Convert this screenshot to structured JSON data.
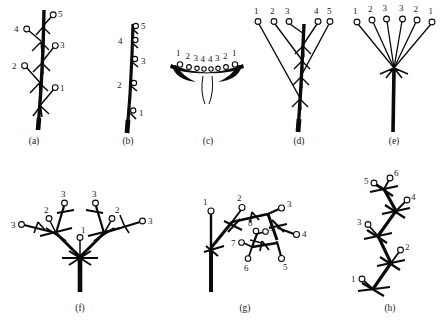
{
  "figure": {
    "background_color": "#ffffff",
    "ink_color": "#0a0a0a",
    "flower_fill_color": "#ffffff",
    "width": 443,
    "height": 327
  },
  "panels": [
    {
      "id": "a",
      "caption": "(a)",
      "caption_x": 34,
      "caption_y": 142,
      "type": "raceme",
      "origin_x": 6,
      "origin_y": 4,
      "axis": {
        "x1": 38,
        "y1": 127,
        "x2": 44,
        "y2": 10
      },
      "flowers": [
        {
          "label": "1",
          "node_x": 40.5,
          "node_y": 105,
          "tip_x": 54,
          "tip_y": 89,
          "num_x": 60,
          "num_y": 88
        },
        {
          "label": "2",
          "node_x": 39.5,
          "node_y": 82,
          "tip_x": 25,
          "tip_y": 66,
          "num_x": 13,
          "num_y": 66
        },
        {
          "label": "3",
          "node_x": 42,
          "node_y": 62,
          "tip_x": 54,
          "tip_y": 46,
          "num_x": 60,
          "num_y": 44
        },
        {
          "label": "4",
          "node_x": 41,
          "node_y": 41,
          "tip_x": 27,
          "tip_y": 29,
          "num_x": 16,
          "num_y": 29
        },
        {
          "label": "5",
          "node_x": 43,
          "node_y": 26,
          "tip_x": 52,
          "tip_y": 15,
          "num_x": 58,
          "num_y": 14
        }
      ],
      "flower_numbers": [
        "1",
        "2",
        "3",
        "4",
        "5"
      ]
    },
    {
      "id": "b",
      "caption": "(b)",
      "caption_x": 128,
      "caption_y": 142,
      "type": "spike",
      "origin_x": 100,
      "origin_y": 4,
      "axis": {
        "x1": 128,
        "y1": 131,
        "x2": 133,
        "y2": 20
      },
      "flowers": [
        {
          "label": "1",
          "node_x": 129.5,
          "node_y": 111,
          "num_x": 139,
          "num_y": 115
        },
        {
          "label": "2",
          "node_x": 130.5,
          "node_y": 84,
          "num_x": 118,
          "num_y": 87
        },
        {
          "label": "3",
          "node_x": 131.5,
          "node_y": 60,
          "num_x": 140,
          "num_y": 63
        },
        {
          "label": "4",
          "node_x": 132,
          "node_y": 41,
          "num_x": 119,
          "num_y": 43
        },
        {
          "label": "5",
          "node_x": 133,
          "node_y": 27,
          "num_x": 141,
          "num_y": 28
        }
      ],
      "flower_numbers": [
        "1",
        "2",
        "3",
        "4",
        "5"
      ]
    },
    {
      "id": "c",
      "caption": "(c)",
      "caption_x": 208,
      "caption_y": 142,
      "type": "capitulum-head",
      "origin_x": 160,
      "origin_y": 40,
      "receptacle": {
        "cx": 207,
        "cy": 68,
        "rx": 36,
        "ry": 7
      },
      "flowers": [
        {
          "label": "1",
          "node_x": 180,
          "node_y": 64,
          "num_x": 177,
          "num_y": 53
        },
        {
          "label": "2",
          "node_x": 189,
          "node_y": 66.5,
          "num_x": 186,
          "num_y": 56
        },
        {
          "label": "3",
          "node_x": 197,
          "node_y": 68,
          "num_x": 194,
          "num_y": 58.5
        },
        {
          "label": "4",
          "node_x": 204,
          "node_y": 68.5,
          "num_x": 201.5,
          "num_y": 59
        },
        {
          "label": "4",
          "node_x": 211,
          "node_y": 68.5,
          "num_x": 209,
          "num_y": 59
        },
        {
          "label": "3",
          "node_x": 218,
          "node_y": 68,
          "num_x": 216,
          "num_y": 58.5
        },
        {
          "label": "2",
          "node_x": 226,
          "node_y": 66.5,
          "num_x": 224,
          "num_y": 56
        },
        {
          "label": "1",
          "node_x": 235,
          "node_y": 64,
          "num_x": 233,
          "num_y": 53
        }
      ],
      "flower_numbers": [
        "1",
        "2",
        "3",
        "4",
        "4",
        "3",
        "2",
        "1"
      ]
    },
    {
      "id": "d",
      "caption": "(d)",
      "caption_x": 299,
      "caption_y": 142,
      "type": "corymb",
      "origin_x": 248,
      "origin_y": 4,
      "axis": {
        "x1": 299,
        "y1": 131,
        "x2": 303,
        "y2": 24
      },
      "flowers": [
        {
          "label": "1",
          "node_x": 300,
          "node_y": 98,
          "tip_x": 258,
          "tip_y": 22,
          "num_x": 255,
          "num_y": 13
        },
        {
          "label": "2",
          "node_x": 301,
          "node_y": 76,
          "tip_x": 330,
          "tip_y": 22,
          "num_x": 328,
          "num_y": 13
        },
        {
          "label": "3",
          "node_x": 301.5,
          "node_y": 60,
          "tip_x": 274,
          "tip_y": 22,
          "num_x": 271,
          "num_y": 13
        },
        {
          "label": "4",
          "node_x": 302,
          "node_y": 45,
          "tip_x": 317,
          "tip_y": 22,
          "num_x": 314,
          "num_y": 13
        },
        {
          "label": "5",
          "node_x": 302.5,
          "node_y": 33,
          "tip_x": 289,
          "tip_y": 22,
          "num_x": 286,
          "num_y": 13
        }
      ],
      "flower_numbers": [
        "1",
        "3",
        "5",
        "4",
        "2"
      ]
    },
    {
      "id": "e",
      "caption": "(e)",
      "caption_x": 394,
      "caption_y": 142,
      "type": "umbel",
      "origin_x": 345,
      "origin_y": 4,
      "axis": {
        "x1": 394,
        "y1": 131,
        "x2": 394,
        "y2": 67
      },
      "hub_x": 394,
      "hub_y": 67,
      "flowers": [
        {
          "label": "1",
          "tip_x": 357,
          "tip_y": 22,
          "num_x": 354,
          "num_y": 13
        },
        {
          "label": "2",
          "tip_x": 372,
          "tip_y": 20,
          "num_x": 369,
          "num_y": 11
        },
        {
          "label": "3",
          "tip_x": 386,
          "tip_y": 19,
          "num_x": 383,
          "num_y": 10
        },
        {
          "label": "3",
          "tip_x": 403,
          "tip_y": 19,
          "num_x": 401,
          "num_y": 10
        },
        {
          "label": "2",
          "tip_x": 417,
          "tip_y": 20,
          "num_x": 415,
          "num_y": 11
        },
        {
          "label": "1",
          "tip_x": 432,
          "tip_y": 22,
          "num_x": 430,
          "num_y": 13
        }
      ],
      "flower_numbers": [
        "1",
        "2",
        "3",
        "3",
        "2",
        "1"
      ]
    },
    {
      "id": "f",
      "caption": "(f)",
      "caption_x": 80,
      "caption_y": 309,
      "type": "dichasial-cyme",
      "origin_x": 8,
      "origin_y": 178,
      "axis": {
        "x1": 80,
        "y1": 290,
        "x2": 80,
        "y2": 255
      },
      "flowers": [
        {
          "label": "1",
          "node_x": 80,
          "node_y": 255,
          "tip_x": 80,
          "tip_y": 238,
          "num_x": 81,
          "num_y": 231
        },
        {
          "label": "2",
          "node_x": 56,
          "node_y": 232,
          "tip_x": 49,
          "tip_y": 219,
          "num_x": 45,
          "num_y": 211
        },
        {
          "label": "2",
          "node_x": 104,
          "node_y": 232,
          "tip_x": 111,
          "tip_y": 219,
          "num_x": 115,
          "num_y": 211
        },
        {
          "label": "3",
          "node_x": 56,
          "node_y": 232,
          "tip_x": 64,
          "tip_y": 203,
          "num_x": 62,
          "num_y": 195
        },
        {
          "label": "3",
          "node_x": 56,
          "node_y": 232,
          "tip_x": 22,
          "tip_y": 224,
          "num_x": 13,
          "num_y": 227
        },
        {
          "label": "3",
          "node_x": 104,
          "node_y": 232,
          "tip_x": 96,
          "tip_y": 203,
          "num_x": 94,
          "num_y": 195
        },
        {
          "label": "3",
          "node_x": 104,
          "node_y": 232,
          "tip_x": 142,
          "tip_y": 221,
          "num_x": 149,
          "num_y": 222
        }
      ],
      "flower_numbers": [
        "1",
        "2",
        "2",
        "3",
        "3",
        "3",
        "3"
      ]
    },
    {
      "id": "g",
      "caption": "(g)",
      "caption_x": 245,
      "caption_y": 309,
      "type": "compound-cyme",
      "origin_x": 190,
      "origin_y": 178,
      "axis": {
        "x1": 211,
        "y1": 290,
        "x2": 211,
        "y2": 232
      },
      "flowers": [
        {
          "label": "1",
          "tip_x": 211,
          "tip_y": 211,
          "num_x": 205,
          "num_y": 202
        },
        {
          "label": "2",
          "tip_x": 241,
          "tip_y": 207,
          "num_x": 238,
          "num_y": 198
        },
        {
          "label": "3",
          "tip_x": 281,
          "tip_y": 208,
          "num_x": 288,
          "num_y": 206
        },
        {
          "label": "4",
          "tip_x": 296,
          "tip_y": 234,
          "num_x": 303,
          "num_y": 235
        },
        {
          "label": "5",
          "tip_x": 281,
          "tip_y": 258,
          "num_x": 283,
          "num_y": 268
        },
        {
          "label": "6",
          "tip_x": 248,
          "tip_y": 258,
          "num_x": 245,
          "num_y": 269
        },
        {
          "label": "7",
          "tip_x": 242,
          "tip_y": 243,
          "num_x": 233,
          "num_y": 244
        },
        {
          "label": "8",
          "tip_x": 256,
          "tip_y": 231,
          "num_x": 250,
          "num_y": 224
        },
        {
          "label": "9",
          "tip_x": 265,
          "tip_y": 231,
          "num_x": 270,
          "num_y": 229
        }
      ],
      "flower_numbers": [
        "1",
        "2",
        "3",
        "4",
        "5",
        "6",
        "7",
        "8",
        "9"
      ]
    },
    {
      "id": "h",
      "caption": "(h)",
      "caption_x": 390,
      "caption_y": 309,
      "type": "scorpioid-cyme",
      "origin_x": 350,
      "origin_y": 175,
      "zigzag": [
        {
          "x": 373,
          "y": 287
        },
        {
          "x": 390,
          "y": 262
        },
        {
          "x": 378,
          "y": 235
        },
        {
          "x": 395,
          "y": 210
        },
        {
          "x": 383,
          "y": 188
        }
      ],
      "flowers": [
        {
          "label": "1",
          "node_x": 373,
          "node_y": 287,
          "tip_x": 362,
          "tip_y": 278,
          "num_x": 353,
          "num_y": 279
        },
        {
          "label": "2",
          "node_x": 390,
          "node_y": 262,
          "tip_x": 400,
          "tip_y": 250,
          "num_x": 406,
          "num_y": 248
        },
        {
          "label": "3",
          "node_x": 378,
          "node_y": 235,
          "tip_x": 368,
          "tip_y": 224,
          "num_x": 359,
          "num_y": 222
        },
        {
          "label": "4",
          "node_x": 395,
          "node_y": 210,
          "tip_x": 407,
          "tip_y": 200,
          "num_x": 413,
          "num_y": 198
        },
        {
          "label": "5",
          "node_x": 383,
          "node_y": 188,
          "tip_x": 374,
          "tip_y": 183,
          "num_x": 366,
          "num_y": 182
        },
        {
          "label": "6",
          "node_x": 383,
          "node_y": 188,
          "tip_x": 390,
          "tip_y": 178,
          "num_x": 395,
          "num_y": 174
        }
      ],
      "flower_numbers": [
        "1",
        "2",
        "3",
        "4",
        "5",
        "6"
      ]
    }
  ]
}
